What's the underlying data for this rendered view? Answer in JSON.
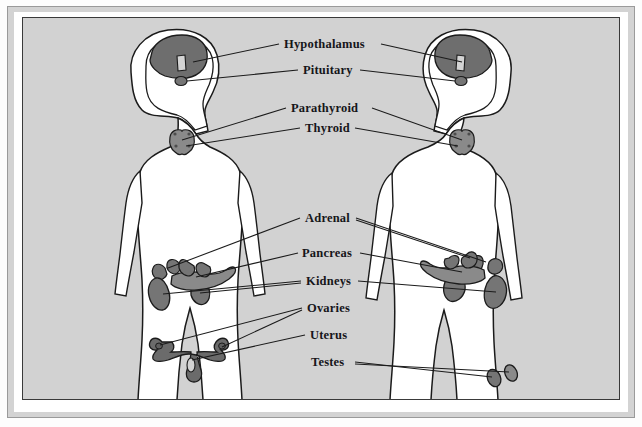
{
  "figure": {
    "type": "anatomical-diagram",
    "background_color": "#d2d2d2",
    "body_fill": "#ffffff",
    "organ_fill": "#757575",
    "brain_fill": "#6e6e6e",
    "outline_color": "#1b1b1b",
    "label_color": "#16161a",
    "frame": {
      "outer_color": "#d3d3d3",
      "inner_border_color": "#3a3a3a",
      "gap_color": "#ffffff"
    }
  },
  "figures": [
    {
      "name": "female-figure",
      "side": "left",
      "facing": "right",
      "sex": "female"
    },
    {
      "name": "male-figure",
      "side": "right",
      "facing": "left",
      "sex": "male"
    }
  ],
  "labels": [
    {
      "id": "hypothalamus",
      "text": "Hypothalamus",
      "x": 284,
      "y": 44,
      "organ_group": "brain",
      "present_in": [
        "female",
        "male"
      ]
    },
    {
      "id": "pituitary",
      "text": "Pituitary",
      "x": 303,
      "y": 70,
      "organ_group": "brain",
      "present_in": [
        "female",
        "male"
      ]
    },
    {
      "id": "parathyroid",
      "text": "Parathyroid",
      "x": 291,
      "y": 108,
      "organ_group": "neck",
      "present_in": [
        "female",
        "male"
      ]
    },
    {
      "id": "thyroid",
      "text": "Thyroid",
      "x": 305,
      "y": 128,
      "organ_group": "neck",
      "present_in": [
        "female",
        "male"
      ]
    },
    {
      "id": "adrenal",
      "text": "Adrenal",
      "x": 305,
      "y": 218,
      "organ_group": "abdomen",
      "present_in": [
        "female",
        "male"
      ]
    },
    {
      "id": "pancreas",
      "text": "Pancreas",
      "x": 302,
      "y": 253,
      "organ_group": "abdomen",
      "present_in": [
        "female",
        "male"
      ]
    },
    {
      "id": "kidneys",
      "text": "Kidneys",
      "x": 306,
      "y": 281,
      "organ_group": "abdomen",
      "present_in": [
        "female",
        "male"
      ]
    },
    {
      "id": "ovaries",
      "text": "Ovaries",
      "x": 307,
      "y": 308,
      "organ_group": "pelvis",
      "present_in": [
        "female"
      ]
    },
    {
      "id": "uterus",
      "text": "Uterus",
      "x": 310,
      "y": 335,
      "organ_group": "pelvis",
      "present_in": [
        "female"
      ]
    },
    {
      "id": "testes",
      "text": "Testes",
      "x": 311,
      "y": 362,
      "organ_group": "pelvis",
      "present_in": [
        "male"
      ]
    }
  ],
  "organs": [
    {
      "id": "brain-female",
      "label": "hypothalamus",
      "shape": "brain-mass"
    },
    {
      "id": "pituitary-female",
      "label": "pituitary",
      "shape": "small-nub"
    },
    {
      "id": "thyroid-female",
      "label": "thyroid",
      "shape": "butterfly"
    },
    {
      "id": "adrenal-kidney-pancreas-female",
      "label": "adrenal",
      "shape": "organ-cluster"
    },
    {
      "id": "uterus-ovaries-female",
      "label": "uterus",
      "shape": "uterus-with-tubes"
    },
    {
      "id": "brain-male",
      "label": "hypothalamus",
      "shape": "brain-mass"
    },
    {
      "id": "pituitary-male",
      "label": "pituitary",
      "shape": "small-nub"
    },
    {
      "id": "thyroid-male",
      "label": "thyroid",
      "shape": "butterfly"
    },
    {
      "id": "adrenal-kidney-pancreas-male",
      "label": "adrenal",
      "shape": "organ-cluster"
    },
    {
      "id": "testes-male",
      "label": "testes",
      "shape": "two-ovals"
    }
  ]
}
